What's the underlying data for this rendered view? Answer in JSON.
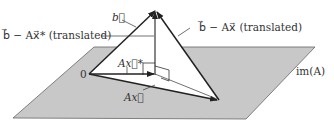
{
  "diagram": {
    "labels": {
      "b": "b⃗",
      "b_minus_Axstar": "b⃗ − Ax⃗* (translated)",
      "b_minus_Ax": "b⃗ − Ax⃗ (translated)",
      "origin": "0",
      "Axstar": "Ax⃗*",
      "Ax": "Ax⃗",
      "plane": "im(A)"
    },
    "colors": {
      "plane_fill": "#c8c8c8",
      "plane_edge": "#555555",
      "vector": "#222222",
      "triangle_fill": "#ffffff"
    }
  }
}
